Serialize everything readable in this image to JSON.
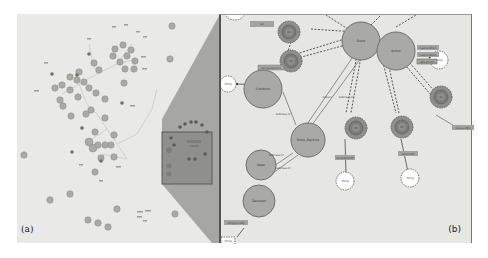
{
  "figure": {
    "panel_a_label": "(a)",
    "panel_b_label": "(b)"
  },
  "colors": {
    "background": "#e9e9e7",
    "class_node": "#a9a9a6",
    "class_node_stroke": "#6f6f6c",
    "instance_node": "#8c8c88",
    "highlight_box": "#8f8f8c",
    "zoom_wedge": "#9a9a97",
    "thing_node": "#ffffff",
    "edge_label_bg": "#a3a3a0"
  },
  "panel_b": {
    "nodes": [
      {
        "id": "event",
        "label": "Event",
        "type": "class"
      },
      {
        "id": "action",
        "label": "Action",
        "type": "class"
      },
      {
        "id": "condition",
        "label": "Condition",
        "type": "class"
      },
      {
        "id": "room_machine",
        "label": "Room_Machine",
        "type": "class"
      },
      {
        "id": "state",
        "label": "State",
        "type": "class"
      },
      {
        "id": "transition",
        "label": "Transition",
        "type": "class"
      },
      {
        "id": "r1",
        "label": "(R)",
        "type": "restriction"
      },
      {
        "id": "r2",
        "label": "(R)",
        "type": "restriction"
      },
      {
        "id": "r3",
        "label": "(R)",
        "type": "restriction"
      },
      {
        "id": "r4",
        "label": "(R)",
        "type": "restriction"
      },
      {
        "id": "r5",
        "label": "(R)",
        "type": "restriction"
      },
      {
        "id": "thing1",
        "label": "Thing",
        "type": "thing"
      },
      {
        "id": "thing2",
        "label": "Thing",
        "type": "thing"
      },
      {
        "id": "thing3",
        "label": "Thing",
        "type": "thing"
      },
      {
        "id": "thing4",
        "label": "Thing",
        "type": "thing"
      },
      {
        "id": "thing5",
        "label": "Thing",
        "type": "thing"
      }
    ],
    "edge_labels": {
      "e1": "isIn",
      "e2": "isConsequence",
      "e3": "hasCondition",
      "e4": "hasCondition",
      "e5": "isRelatedTo",
      "e6": "Subset",
      "e7": "Subclass of",
      "e8": "Subclass of",
      "e9": "Subclass of",
      "e10": "Subclass of",
      "e11": "isConditionOf",
      "e12": "isActionOf",
      "e13": "isCausedBy",
      "e14": "isTriggeredBy"
    }
  }
}
